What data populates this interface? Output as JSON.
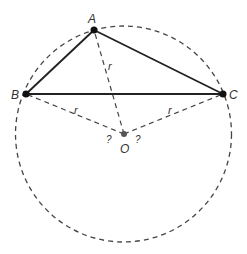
{
  "diagram": {
    "colors": {
      "background": "#ffffff",
      "solid_line": "#222222",
      "dashed_line": "#444444",
      "point": "#111111",
      "center_point": "#555555",
      "label": "#333333"
    },
    "circle": {
      "cx": 123.5,
      "cy": 134,
      "r": 108
    },
    "points": {
      "A": {
        "label": "A",
        "x": 94,
        "y": 30
      },
      "B": {
        "label": "B",
        "x": 26,
        "y": 94
      },
      "C": {
        "label": "C",
        "x": 223,
        "y": 94
      },
      "O": {
        "label": "O",
        "x": 124,
        "y": 134
      }
    },
    "radius_labels": [
      {
        "text": "r",
        "x": 110,
        "y": 69
      },
      {
        "text": "r",
        "x": 76,
        "y": 112
      },
      {
        "text": "r",
        "x": 170,
        "y": 112
      }
    ],
    "unknown_labels": [
      {
        "text": "?",
        "x": 109,
        "y": 142
      },
      {
        "text": "?",
        "x": 138,
        "y": 142
      }
    ]
  }
}
